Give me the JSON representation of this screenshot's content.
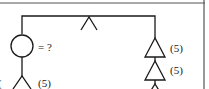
{
  "diagram": {
    "type": "fault-tree-fragment",
    "colors": {
      "line": "#1a1a1a",
      "border": "#555555",
      "background": "#ffffff"
    },
    "nodes": [
      {
        "id": "top-gate",
        "shape": "and-gate-caret",
        "label": ""
      },
      {
        "id": "unknown-event",
        "shape": "circle",
        "label": "= ?"
      },
      {
        "id": "left-gate",
        "shape": "caret",
        "label": "(5)"
      },
      {
        "id": "right-gate-1",
        "shape": "triangle",
        "label": "(5)"
      },
      {
        "id": "right-gate-2",
        "shape": "triangle",
        "label": "(5)"
      },
      {
        "id": "right-gate-3",
        "shape": "triangle",
        "label": ""
      }
    ],
    "edge_label_left": "("
  }
}
